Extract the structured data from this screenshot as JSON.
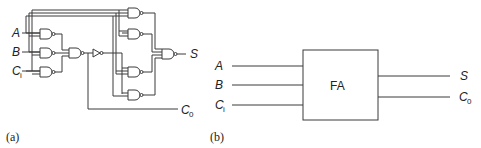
{
  "figure_a": {
    "caption": "(a)",
    "inputs": [
      {
        "name": "A",
        "sub": ""
      },
      {
        "name": "B",
        "sub": ""
      },
      {
        "name": "C",
        "sub": "i"
      }
    ],
    "outputs": [
      {
        "name": "S",
        "sub": ""
      },
      {
        "name": "C",
        "sub": "0"
      }
    ]
  },
  "figure_b": {
    "caption": "(b)",
    "block_label": "FA",
    "inputs": [
      {
        "name": "A",
        "sub": ""
      },
      {
        "name": "B",
        "sub": ""
      },
      {
        "name": "C",
        "sub": "i"
      }
    ],
    "outputs": [
      {
        "name": "S",
        "sub": ""
      },
      {
        "name": "C",
        "sub": "0"
      }
    ]
  },
  "colors": {
    "line": "#3a3a3a",
    "text": "#222222",
    "background": "#ffffff"
  }
}
